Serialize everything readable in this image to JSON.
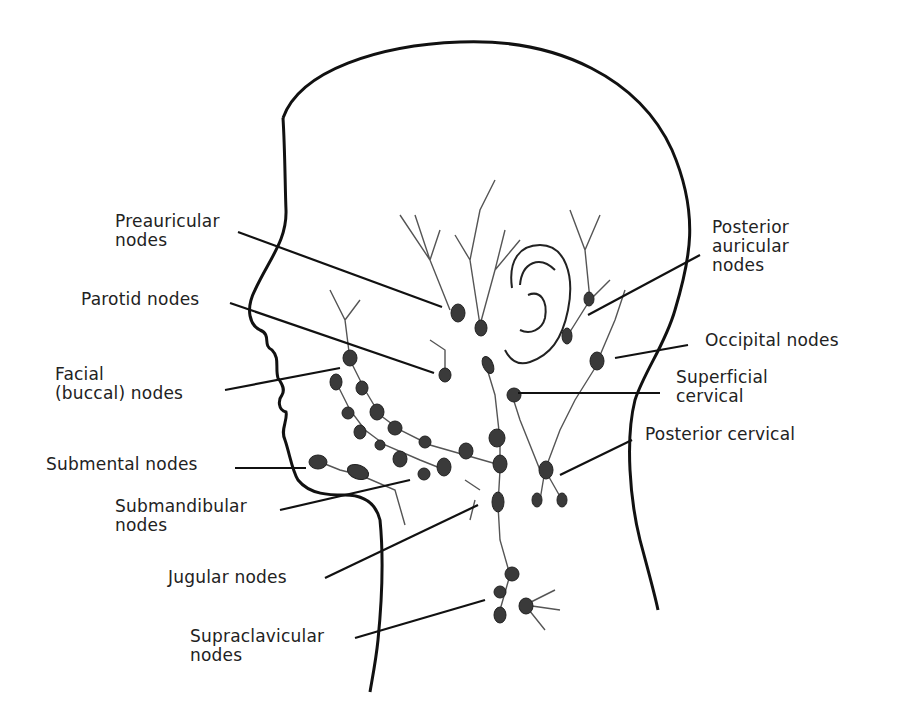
{
  "diagram": {
    "colors": {
      "outline": "#111111",
      "vessel": "#444444",
      "node": "#3a3a3a",
      "background": "#ffffff"
    },
    "labels": {
      "preauricular": "Preauricular\nnodes",
      "parotid": "Parotid nodes",
      "facial": "Facial\n(buccal) nodes",
      "submental": "Submental nodes",
      "submandibular": "Submandibular\nnodes",
      "jugular": "Jugular nodes",
      "supraclavicular": "Supraclavicular\nnodes",
      "posterior_auricular": "Posterior\nauricular\nnodes",
      "occipital": "Occipital nodes",
      "superficial_cervical": "Superficial\ncervical",
      "posterior_cervical": "Posterior cervical"
    }
  }
}
